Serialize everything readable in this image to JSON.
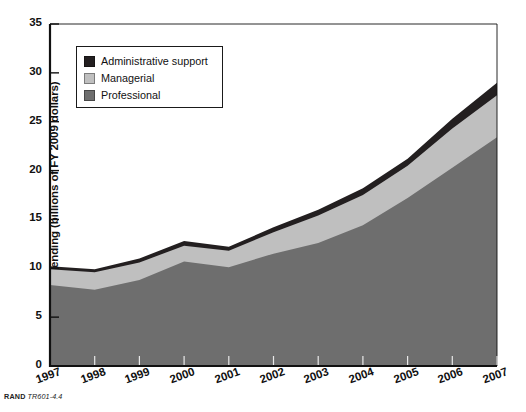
{
  "figure": {
    "source_brand": "RAND",
    "source_ref": "TR601-4.4"
  },
  "legend": {
    "position": "inside-top-left",
    "items": [
      {
        "label": "Administrative support",
        "color": "#231f20",
        "name": "administrative-support"
      },
      {
        "label": "Managerial",
        "color": "#bfbfbf",
        "name": "managerial"
      },
      {
        "label": "Professional",
        "color": "#6e6e6e",
        "name": "professional"
      }
    ]
  },
  "chart_data": {
    "type": "area",
    "stacked": true,
    "title": "",
    "xlabel": "",
    "ylabel": "Spending (billions of FY 2009 dollars)",
    "categories": [
      "1997",
      "1998",
      "1999",
      "2000",
      "2001",
      "2002",
      "2003",
      "2004",
      "2005",
      "2006",
      "2007"
    ],
    "x": [
      1997,
      1998,
      1999,
      2000,
      2001,
      2002,
      2003,
      2004,
      2005,
      2006,
      2007
    ],
    "xlim": [
      1997,
      2007
    ],
    "ylim": [
      0,
      35
    ],
    "yticks": [
      0,
      5,
      10,
      15,
      20,
      25,
      30,
      35
    ],
    "xticks": [
      "1997",
      "1998",
      "1999",
      "2000",
      "2001",
      "2002",
      "2003",
      "2004",
      "2005",
      "2006",
      "2007"
    ],
    "grid": false,
    "stack_order_bottom_to_top": [
      "Professional",
      "Managerial",
      "Administrative support"
    ],
    "series": [
      {
        "name": "Professional",
        "color": "#6e6e6e",
        "values": [
          8.3,
          7.8,
          8.8,
          10.7,
          10.1,
          11.5,
          12.6,
          14.4,
          17.2,
          20.3,
          23.4
        ]
      },
      {
        "name": "Managerial",
        "color": "#bfbfbf",
        "values": [
          1.6,
          1.8,
          1.8,
          1.6,
          1.7,
          2.2,
          2.8,
          3.1,
          3.3,
          4.0,
          4.3
        ]
      },
      {
        "name": "Administrative support",
        "color": "#231f20",
        "values": [
          0.3,
          0.3,
          0.4,
          0.5,
          0.4,
          0.5,
          0.6,
          0.7,
          0.7,
          1.0,
          1.3
        ]
      }
    ],
    "cumulative_tops": {
      "Professional": [
        8.3,
        7.8,
        8.8,
        10.7,
        10.1,
        11.5,
        12.6,
        14.4,
        17.2,
        20.3,
        23.4
      ],
      "Managerial": [
        9.9,
        9.6,
        10.6,
        12.3,
        11.8,
        13.7,
        15.4,
        17.5,
        20.5,
        24.3,
        27.7
      ],
      "Administrative support": [
        10.2,
        9.9,
        11.0,
        12.8,
        12.2,
        14.2,
        16.0,
        18.2,
        21.2,
        25.3,
        29.0
      ]
    }
  }
}
